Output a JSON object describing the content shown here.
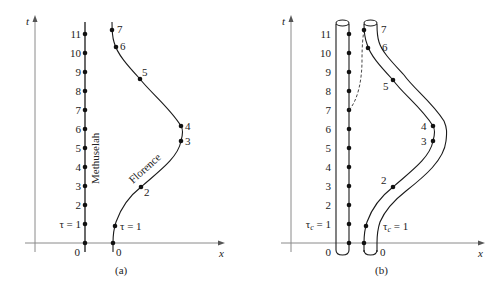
{
  "figure": {
    "panels": [
      {
        "id": "a",
        "caption": "(a)",
        "axis_t_label": "t",
        "axis_x_label": "x",
        "worldline_labels": {
          "methuselah": "Methuselah",
          "florence": "Florence"
        },
        "methuselah_ticks": [
          "0",
          "τ = 1",
          "2",
          "3",
          "4",
          "5",
          "6",
          "7",
          "8",
          "9",
          "10",
          "11"
        ],
        "florence_ticks": [
          "0",
          "τ = 1",
          "2",
          "3",
          "4",
          "5",
          "6",
          "7"
        ]
      },
      {
        "id": "b",
        "caption": "(b)",
        "axis_t_label": "t",
        "axis_x_label": "x",
        "methuselah_ticks": [
          "0",
          "τc = 1",
          "2",
          "3",
          "4",
          "5",
          "6",
          "7",
          "8",
          "9",
          "10",
          "11"
        ],
        "florence_ticks": [
          "0",
          "τc = 1",
          "2",
          "3",
          "4",
          "5",
          "6",
          "7"
        ],
        "tau_c_symbol": "τ",
        "tau_c_sub": "c",
        "tau_c_rest": " = 1"
      }
    ],
    "labels": {
      "t": "t",
      "x": "x",
      "cap_a": "(a)",
      "cap_b": "(b)",
      "methuselah": "Methuselah",
      "florence": "Florence",
      "zero": "0",
      "tau1": "τ = 1",
      "n2": "2",
      "n3": "3",
      "n4": "4",
      "n5": "5",
      "n6": "6",
      "n7": "7",
      "n8": "8",
      "n9": "9",
      "n10": "10",
      "n11": "11",
      "tau": "τ",
      "c": "c",
      "eq1": " = 1"
    }
  }
}
